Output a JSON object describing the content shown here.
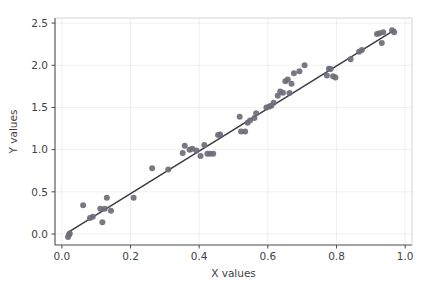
{
  "chart_data": {
    "type": "scatter",
    "title": "",
    "xlabel": "X values",
    "ylabel": "Y values",
    "xlim": [
      -0.02,
      1.02
    ],
    "ylim": [
      -0.13,
      2.56
    ],
    "xticks": [
      "0.0",
      "0.2",
      "0.4",
      "0.6",
      "0.8",
      "1.0"
    ],
    "xtick_values": [
      0.0,
      0.2,
      0.4,
      0.6,
      0.8,
      1.0
    ],
    "yticks": [
      "0.0",
      "0.5",
      "1.0",
      "1.5",
      "2.0",
      "2.5"
    ],
    "ytick_values": [
      0.0,
      0.5,
      1.0,
      1.5,
      2.0,
      2.5
    ],
    "grid": true,
    "legend": "none",
    "marker_color": "#6e6e78",
    "line_color": "#3a3a42",
    "grid_color": "#d9d9de",
    "background_color": "#ffffff",
    "series": [
      {
        "name": "observations",
        "type": "scatter",
        "points": [
          [
            0.018,
            -0.035
          ],
          [
            0.021,
            -0.01
          ],
          [
            0.023,
            0.005
          ],
          [
            0.062,
            0.34
          ],
          [
            0.082,
            0.19
          ],
          [
            0.09,
            0.205
          ],
          [
            0.112,
            0.3
          ],
          [
            0.118,
            0.14
          ],
          [
            0.125,
            0.3
          ],
          [
            0.131,
            0.43
          ],
          [
            0.143,
            0.275
          ],
          [
            0.209,
            0.43
          ],
          [
            0.263,
            0.78
          ],
          [
            0.31,
            0.765
          ],
          [
            0.352,
            0.96
          ],
          [
            0.358,
            1.045
          ],
          [
            0.372,
            1.0
          ],
          [
            0.38,
            1.01
          ],
          [
            0.392,
            0.99
          ],
          [
            0.404,
            0.925
          ],
          [
            0.415,
            1.055
          ],
          [
            0.424,
            0.95
          ],
          [
            0.432,
            0.95
          ],
          [
            0.441,
            0.95
          ],
          [
            0.455,
            1.175
          ],
          [
            0.461,
            1.18
          ],
          [
            0.518,
            1.39
          ],
          [
            0.522,
            1.215
          ],
          [
            0.534,
            1.215
          ],
          [
            0.541,
            1.32
          ],
          [
            0.548,
            1.345
          ],
          [
            0.561,
            1.375
          ],
          [
            0.566,
            1.43
          ],
          [
            0.596,
            1.5
          ],
          [
            0.604,
            1.51
          ],
          [
            0.61,
            1.52
          ],
          [
            0.617,
            1.555
          ],
          [
            0.629,
            1.64
          ],
          [
            0.636,
            1.69
          ],
          [
            0.644,
            1.675
          ],
          [
            0.651,
            1.81
          ],
          [
            0.658,
            1.83
          ],
          [
            0.663,
            1.67
          ],
          [
            0.669,
            1.78
          ],
          [
            0.676,
            1.905
          ],
          [
            0.692,
            1.93
          ],
          [
            0.707,
            2.0
          ],
          [
            0.772,
            1.88
          ],
          [
            0.778,
            1.96
          ],
          [
            0.783,
            1.955
          ],
          [
            0.79,
            1.87
          ],
          [
            0.797,
            1.855
          ],
          [
            0.841,
            2.07
          ],
          [
            0.866,
            2.16
          ],
          [
            0.874,
            2.18
          ],
          [
            0.918,
            2.37
          ],
          [
            0.925,
            2.38
          ],
          [
            0.932,
            2.265
          ],
          [
            0.936,
            2.39
          ],
          [
            0.962,
            2.415
          ],
          [
            0.968,
            2.39
          ]
        ]
      },
      {
        "name": "fit-line",
        "type": "line",
        "x": [
          0.018,
          0.972
        ],
        "y": [
          0.02,
          2.425
        ],
        "slope": 2.52,
        "intercept": -0.025
      }
    ]
  }
}
